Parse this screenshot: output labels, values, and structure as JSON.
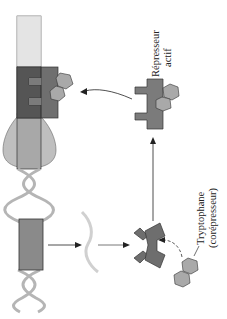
{
  "labels": {
    "active_repressor_line1": "Répresseur",
    "active_repressor_line2": "actif",
    "tryptophan_line1": "Tryptophane",
    "tryptophan_line2": "(corépresseur)"
  },
  "colors": {
    "operator_dark": "#5e5e5e",
    "repressor": "#7b7b7b",
    "tryptophan": "#a9a9a9",
    "gene_box": "#8a8a8a",
    "polymerase": "#bdbdbd",
    "dna_bar": "#d9d9d9",
    "helix": "#b8b8b8",
    "mrna": "#cfcfcf",
    "outline": "#333333"
  }
}
